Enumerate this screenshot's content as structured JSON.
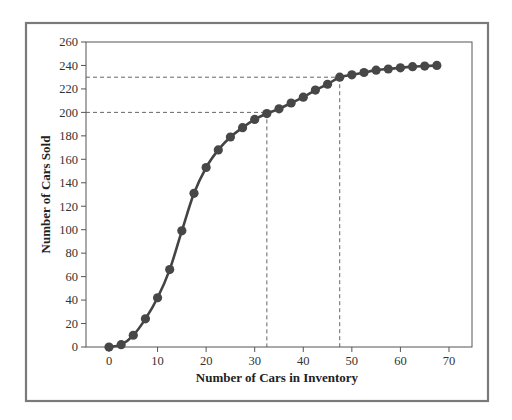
{
  "chart_data": {
    "type": "line",
    "title": "",
    "xlabel": "Number of Cars in Inventory",
    "ylabel": "Number of Cars Sold",
    "xlim": [
      -5,
      75
    ],
    "ylim": [
      0,
      260
    ],
    "x_ticks": [
      0,
      10,
      20,
      30,
      40,
      50,
      60,
      70
    ],
    "y_ticks": [
      0,
      20,
      40,
      60,
      80,
      100,
      120,
      140,
      160,
      180,
      200,
      220,
      240,
      260
    ],
    "grid": false,
    "legend": null,
    "series": [
      {
        "name": "Cars Sold",
        "color": "#444444",
        "marker": "circle",
        "x": [
          0,
          2.5,
          5,
          7.5,
          10,
          12.5,
          15,
          17.5,
          20,
          22.5,
          25,
          27.5,
          30,
          32.5,
          35,
          37.5,
          40,
          42.5,
          45,
          47.5,
          50,
          52.5,
          55,
          57.5,
          60,
          62.5,
          65,
          67.5
        ],
        "values": [
          0,
          2,
          10,
          24,
          42,
          66,
          99,
          131,
          153,
          168,
          179,
          187,
          194,
          199,
          203,
          208,
          213,
          219,
          224,
          230,
          232,
          234,
          236,
          237,
          238,
          239,
          239.5,
          240
        ]
      }
    ],
    "annotations": [
      {
        "type": "dashed-reference",
        "x": 32.5,
        "y": 200,
        "description": "200 cars sold at ~32.5 inventory"
      },
      {
        "type": "dashed-reference",
        "x": 47.5,
        "y": 230,
        "description": "230 cars sold at ~47.5 inventory"
      }
    ]
  },
  "layout": {
    "outer_frame": {
      "left": 26,
      "top": 23,
      "right": 488,
      "bottom": 401
    },
    "plot_area": {
      "left": 86,
      "top": 42,
      "right": 472,
      "bottom": 347
    },
    "x_zero_px": 109,
    "x_px_per_unit": 4.857
  }
}
